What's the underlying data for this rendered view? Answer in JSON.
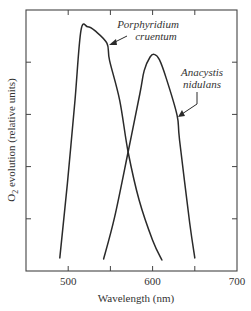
{
  "chart_data": {
    "type": "line",
    "title": "",
    "xlabel": "Wavelength  (nm)",
    "ylabel_main": "O",
    "ylabel_sub": "2",
    "ylabel_rest": " evolution  (relative units)",
    "xlim": [
      450,
      700
    ],
    "ylim": [
      0,
      5
    ],
    "xticks": [
      450,
      500,
      550,
      600,
      650,
      700
    ],
    "xtick_labels": [
      {
        "value": 500,
        "label": "500"
      },
      {
        "value": 600,
        "label": "600"
      },
      {
        "value": 700,
        "label": "700"
      }
    ],
    "yticks": [
      1,
      2,
      3,
      4
    ],
    "grid": false,
    "legend": "none",
    "series": [
      {
        "name": "Porphyridium cruentum",
        "label_lines": [
          "Porphyridium",
          "cruentum"
        ],
        "x": [
          490,
          499,
          508,
          515,
          523,
          532,
          546,
          549,
          561,
          571,
          584,
          600,
          611
        ],
        "y": [
          0.25,
          1.68,
          3.27,
          4.6,
          4.68,
          4.6,
          4.36,
          4.03,
          3.27,
          2.28,
          1.36,
          0.59,
          0.21
        ]
      },
      {
        "name": "Anacystis nidulans",
        "label_lines": [
          "Anacystis",
          "nidulans"
        ],
        "x": [
          542,
          555,
          571,
          585,
          590,
          597,
          602,
          608,
          616,
          629,
          632,
          644,
          650
        ],
        "y": [
          0.23,
          1.03,
          2.28,
          3.4,
          3.84,
          4.1,
          4.15,
          4.05,
          3.7,
          2.98,
          2.5,
          0.92,
          0.25
        ]
      }
    ],
    "annotations": [
      {
        "text_lines": [
          "Porphyridium",
          "cruentum"
        ],
        "points_to": "Porphyridium cruentum",
        "at_x": 546,
        "at_y": 4.36
      },
      {
        "text_lines": [
          "Anacystis",
          "nidulans"
        ],
        "points_to": "Anacystis nidulans",
        "at_x": 629,
        "at_y": 2.98
      }
    ]
  }
}
